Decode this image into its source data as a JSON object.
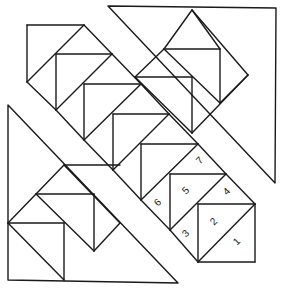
{
  "diagram": {
    "stroke_color": "#1a1a1a",
    "background": "#ffffff",
    "large_triangles": [
      {
        "name": "top-right-triangle",
        "points": [
          [
            108,
            6
          ],
          [
            276,
            8
          ],
          [
            275,
            183
          ]
        ]
      },
      {
        "name": "bottom-left-triangle",
        "points": [
          [
            8,
            105
          ],
          [
            8,
            280
          ],
          [
            178,
            283
          ]
        ]
      }
    ],
    "strip_lines": [
      [
        [
          27,
          25
        ],
        [
          84,
          25
        ]
      ],
      [
        [
          27,
          25
        ],
        [
          27,
          82
        ]
      ],
      [
        [
          84,
          25
        ],
        [
          27,
          82
        ]
      ],
      [
        [
          84,
          25
        ],
        [
          112,
          54
        ]
      ],
      [
        [
          56,
          54
        ],
        [
          112,
          54
        ]
      ],
      [
        [
          56,
          54
        ],
        [
          56,
          110
        ]
      ],
      [
        [
          27,
          82
        ],
        [
          56,
          110
        ]
      ],
      [
        [
          112,
          54
        ],
        [
          56,
          110
        ]
      ],
      [
        [
          112,
          54
        ],
        [
          141,
          84
        ]
      ],
      [
        [
          84,
          84
        ],
        [
          141,
          84
        ]
      ],
      [
        [
          84,
          84
        ],
        [
          84,
          140
        ]
      ],
      [
        [
          56,
          110
        ],
        [
          84,
          140
        ]
      ],
      [
        [
          141,
          84
        ],
        [
          84,
          140
        ]
      ],
      [
        [
          141,
          84
        ],
        [
          169,
          114
        ]
      ],
      [
        [
          113,
          114
        ],
        [
          169,
          114
        ]
      ],
      [
        [
          113,
          114
        ],
        [
          113,
          170
        ]
      ],
      [
        [
          84,
          140
        ],
        [
          113,
          170
        ]
      ],
      [
        [
          169,
          114
        ],
        [
          113,
          170
        ]
      ],
      [
        [
          169,
          114
        ],
        [
          198,
          144
        ]
      ],
      [
        [
          141,
          144
        ],
        [
          198,
          144
        ]
      ],
      [
        [
          141,
          144
        ],
        [
          141,
          200
        ]
      ],
      [
        [
          113,
          170
        ],
        [
          141,
          200
        ]
      ],
      [
        [
          198,
          144
        ],
        [
          141,
          200
        ]
      ],
      [
        [
          198,
          144
        ],
        [
          226,
          174
        ]
      ],
      [
        [
          170,
          174
        ],
        [
          226,
          174
        ]
      ],
      [
        [
          170,
          174
        ],
        [
          170,
          230
        ]
      ],
      [
        [
          141,
          200
        ],
        [
          170,
          230
        ]
      ],
      [
        [
          226,
          174
        ],
        [
          170,
          230
        ]
      ],
      [
        [
          226,
          174
        ],
        [
          255,
          204
        ]
      ],
      [
        [
          198,
          204
        ],
        [
          255,
          204
        ]
      ],
      [
        [
          198,
          204
        ],
        [
          198,
          262
        ]
      ],
      [
        [
          255,
          204
        ],
        [
          255,
          262
        ]
      ],
      [
        [
          198,
          262
        ],
        [
          255,
          262
        ]
      ],
      [
        [
          255,
          204
        ],
        [
          198,
          262
        ]
      ],
      [
        [
          170,
          230
        ],
        [
          198,
          262
        ]
      ],
      [
        [
          164,
          49
        ],
        [
          220,
          49
        ]
      ],
      [
        [
          192,
          10
        ],
        [
          164,
          49
        ]
      ],
      [
        [
          192,
          10
        ],
        [
          220,
          49
        ]
      ],
      [
        [
          220,
          49
        ],
        [
          220,
          103
        ]
      ],
      [
        [
          164,
          49
        ],
        [
          220,
          103
        ]
      ],
      [
        [
          220,
          103
        ],
        [
          248,
          75
        ]
      ],
      [
        [
          192,
          10
        ],
        [
          248,
          75
        ]
      ],
      [
        [
          135,
          77
        ],
        [
          192,
          77
        ]
      ],
      [
        [
          164,
          49
        ],
        [
          135,
          77
        ]
      ],
      [
        [
          192,
          77
        ],
        [
          192,
          133
        ]
      ],
      [
        [
          135,
          77
        ],
        [
          192,
          133
        ]
      ],
      [
        [
          192,
          133
        ],
        [
          248,
          75
        ]
      ],
      [
        [
          36,
          194
        ],
        [
          94,
          194
        ]
      ],
      [
        [
          64,
          165
        ],
        [
          36,
          194
        ]
      ],
      [
        [
          64,
          165
        ],
        [
          120,
          223
        ]
      ],
      [
        [
          94,
          194
        ],
        [
          94,
          251
        ]
      ],
      [
        [
          36,
          194
        ],
        [
          94,
          251
        ]
      ],
      [
        [
          94,
          251
        ],
        [
          120,
          223
        ]
      ],
      [
        [
          64,
          165
        ],
        [
          120,
          165
        ]
      ],
      [
        [
          8,
          223
        ],
        [
          64,
          223
        ]
      ],
      [
        [
          36,
          194
        ],
        [
          8,
          223
        ]
      ],
      [
        [
          64,
          223
        ],
        [
          64,
          280
        ]
      ],
      [
        [
          8,
          223
        ],
        [
          64,
          280
        ]
      ]
    ],
    "labels": [
      {
        "text": "1",
        "x": 237,
        "y": 242,
        "rotate": -45
      },
      {
        "text": "2",
        "x": 214,
        "y": 222,
        "rotate": -45
      },
      {
        "text": "3",
        "x": 186,
        "y": 234,
        "rotate": -45
      },
      {
        "text": "4",
        "x": 227,
        "y": 192,
        "rotate": -45
      },
      {
        "text": "5",
        "x": 186,
        "y": 191,
        "rotate": -45
      },
      {
        "text": "6",
        "x": 158,
        "y": 203,
        "rotate": -45
      },
      {
        "text": "7",
        "x": 200,
        "y": 161,
        "rotate": -45
      }
    ]
  }
}
